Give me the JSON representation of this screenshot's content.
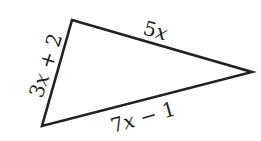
{
  "diagram": {
    "type": "triangle",
    "vertices": {
      "top_left": [
        72,
        20
      ],
      "right": [
        252,
        72
      ],
      "bottom_left": [
        42,
        126
      ]
    },
    "stroke_color": "#222222",
    "sides": {
      "left": {
        "label": "3x + 2",
        "coef": "3",
        "var": "x",
        "rest": " + 2"
      },
      "top": {
        "label": "5x",
        "coef": "5",
        "var": "x",
        "rest": ""
      },
      "bottom": {
        "label": "7x − 1",
        "coef": "7",
        "var": "x",
        "rest": " − 1"
      }
    }
  }
}
